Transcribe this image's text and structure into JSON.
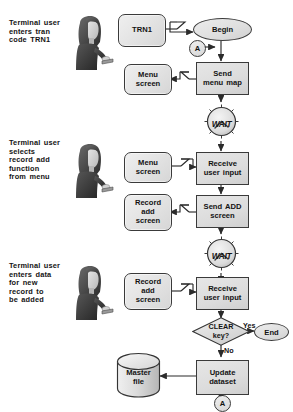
{
  "diagram": {
    "type": "flowchart",
    "background": "#ffffff",
    "ink": "#131313",
    "fill_light": "#ececec",
    "fill_mid": "#dcdcdc",
    "fill_dark": "#cfcfcf"
  },
  "captions": [
    {
      "id": "caption-1",
      "text": "Terminal user enters tran code TRN1"
    },
    {
      "id": "caption-2",
      "text": "Terminal user selects record add function from menu"
    },
    {
      "id": "caption-3",
      "text": "Terminal user enters data for new record to be added"
    }
  ],
  "caption_lines": {
    "one": [
      "Terminal  user",
      "enters  tran",
      "code TRN1"
    ],
    "two": [
      "Terminal  user",
      "selects",
      "record  add",
      "function",
      "from  menu"
    ],
    "three": [
      "Terminal  user",
      "enters  data",
      "for  new",
      "record  to",
      "be  added"
    ]
  },
  "screens": [
    {
      "id": "screen-trn1",
      "lines": [
        "TRN1"
      ]
    },
    {
      "id": "screen-menu-1",
      "lines": [
        "Menu",
        "screen"
      ]
    },
    {
      "id": "screen-menu-2",
      "lines": [
        "Menu",
        "screen"
      ]
    },
    {
      "id": "screen-record-1",
      "lines": [
        "Record",
        "add",
        "screen"
      ]
    },
    {
      "id": "screen-record-2",
      "lines": [
        "Record",
        "add",
        "screen"
      ]
    }
  ],
  "processes": [
    {
      "id": "proc-send-menu-map",
      "lines": [
        "Send",
        "menu  map"
      ]
    },
    {
      "id": "proc-receive-input-1",
      "lines": [
        "Receive",
        "user  input"
      ]
    },
    {
      "id": "proc-send-add",
      "lines": [
        "Send  ADD",
        "screen"
      ]
    },
    {
      "id": "proc-receive-input-2",
      "lines": [
        "Receive",
        "user  input"
      ]
    },
    {
      "id": "proc-update-dataset",
      "lines": [
        "Update",
        "dataset"
      ]
    }
  ],
  "terminators": [
    {
      "id": "terminator-begin",
      "label": "Begin"
    },
    {
      "id": "terminator-end",
      "label": "End"
    }
  ],
  "connectors": [
    {
      "id": "connector-a-top",
      "label": "A"
    },
    {
      "id": "connector-a-bottom",
      "label": "A"
    }
  ],
  "waits": [
    {
      "id": "wait-clock-1",
      "label": "WAIT"
    },
    {
      "id": "wait-clock-2",
      "label": "WAIT"
    }
  ],
  "decision": {
    "id": "decision-clear-key",
    "lines": [
      "CLEAR",
      "key?"
    ],
    "yes_label": "Yes",
    "no_label": "No"
  },
  "datastore": {
    "id": "datastore-master-file",
    "lines": [
      "Master",
      "file"
    ]
  }
}
